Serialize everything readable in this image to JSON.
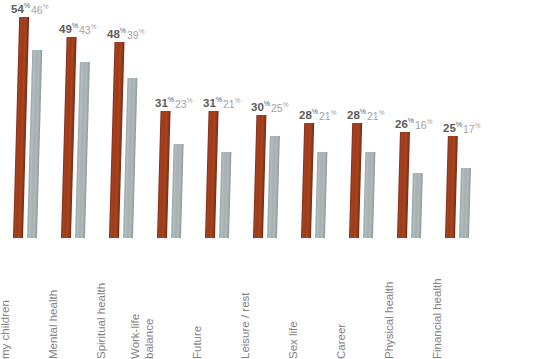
{
  "chart_data": {
    "type": "bar",
    "title": "",
    "subtitle": "",
    "xlabel": "",
    "ylabel": "",
    "ylim": [
      0,
      56
    ],
    "grid": false,
    "legend": "none",
    "orientation": "vertical",
    "value_suffix": "%",
    "categories": [
      "Relationship with my children",
      "Mental health",
      "Spiritual health",
      "Work-life balance",
      "Future",
      "Leisure / rest",
      "Sex life",
      "Career",
      "Physical health",
      "Financial health"
    ],
    "category_lines": [
      [
        "Relationship with",
        "my children"
      ],
      [
        "Mental health"
      ],
      [
        "Spiritual health"
      ],
      [
        "Work-life",
        "balance"
      ],
      [
        "Future"
      ],
      [
        "Leisure / rest"
      ],
      [
        "Sex life"
      ],
      [
        "Career"
      ],
      [
        "Physical health"
      ],
      [
        "Financial health"
      ]
    ],
    "series": [
      {
        "name": "series-a",
        "color": "#9d3a1b",
        "values": [
          54,
          49,
          48,
          31,
          31,
          30,
          28,
          28,
          26,
          25
        ]
      },
      {
        "name": "series-b",
        "color": "#a8b2b5",
        "values": [
          46,
          43,
          39,
          23,
          21,
          25,
          21,
          21,
          16,
          17
        ]
      }
    ],
    "labels_a": [
      "54",
      "49",
      "48",
      "31",
      "31",
      "30",
      "28",
      "28",
      "26",
      "25"
    ],
    "labels_b": [
      "46",
      "43",
      "39",
      "23",
      "21",
      "25",
      "21",
      "21",
      "16",
      "17"
    ]
  },
  "colors": {
    "series_a": "#9d3a1b",
    "series_b": "#a8b2b5",
    "label_a": "#5d5a57",
    "label_b": "#a5a2a0",
    "category_text": "#868381",
    "background": "#ffffff"
  }
}
